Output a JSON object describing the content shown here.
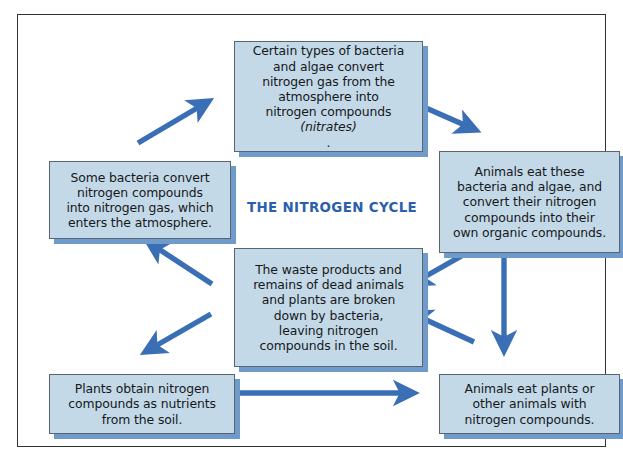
{
  "diagram": {
    "title": "THE NITROGEN CYCLE",
    "accent_color": "#2a5fad",
    "arrow_color": "#3a6fb5",
    "box_fill": "#c3d9e8",
    "box_border": "#5a6470",
    "box_shadow": "#6e9bc9",
    "frame_border": "#2f3336"
  },
  "boxes": {
    "fixation": {
      "text_plain": "Certain types of bacteria and algae convert nitrogen gas from the atmosphere into nitrogen compounds (nitrates).",
      "line1": "Certain types of bacteria",
      "line2": "and algae convert",
      "line3": "nitrogen gas from the",
      "line4": "atmosphere into",
      "line5": "nitrogen compounds",
      "line6_italic": "(nitrates)",
      "line6_tail": "."
    },
    "animals_eat_microbes": {
      "text_plain": "Animals eat these bacteria and algae, and convert their nitrogen compounds into their own organic compounds.",
      "line1": "Animals eat these",
      "line2": "bacteria and algae, and",
      "line3": "convert their nitrogen",
      "line4": "compounds into their",
      "line5": "own organic compounds."
    },
    "denitrification": {
      "text_plain": "Some bacteria convert nitrogen compounds into nitrogen gas, which enters the atmosphere.",
      "line1": "Some bacteria convert",
      "line2": "nitrogen compounds",
      "line3": "into nitrogen gas, which",
      "line4": "enters the atmosphere."
    },
    "decomposition": {
      "text_plain": "The waste products and remains of dead animals and plants are broken down by bacteria, leaving nitrogen compounds in the soil.",
      "line1": "The waste products and",
      "line2": "remains of dead animals",
      "line3": "and plants are broken",
      "line4": "down by bacteria,",
      "line5": "leaving nitrogen",
      "line6": "compounds in the soil."
    },
    "plants_uptake": {
      "text_plain": "Plants obtain nitrogen compounds as nutrients from the soil.",
      "line1": "Plants obtain nitrogen",
      "line2": "compounds as nutrients",
      "line3": "from the soil."
    },
    "animals_eat_plants": {
      "text_plain": "Animals eat plants or other animals with nitrogen compounds.",
      "line1": "Animals eat plants or",
      "line2": "other animals with",
      "line3": "nitrogen compounds."
    }
  },
  "arrows": [
    {
      "name": "denitrification-to-fixation",
      "from": "denitrification",
      "to": "fixation",
      "direction": "up-right"
    },
    {
      "name": "fixation-to-animals-eat-microbes",
      "from": "fixation",
      "to": "animals_eat_microbes",
      "direction": "down-right"
    },
    {
      "name": "animals-eat-microbes-to-decomposition",
      "from": "animals_eat_microbes",
      "to": "decomposition",
      "direction": "down-left"
    },
    {
      "name": "animals-eat-microbes-to-animals-eat-plants",
      "from": "animals_eat_microbes",
      "to": "animals_eat_plants",
      "direction": "down"
    },
    {
      "name": "animals-eat-plants-to-decomposition",
      "from": "animals_eat_plants",
      "to": "decomposition",
      "direction": "up-left"
    },
    {
      "name": "decomposition-to-denitrification",
      "from": "decomposition",
      "to": "denitrification",
      "direction": "up-left"
    },
    {
      "name": "decomposition-to-plants-uptake",
      "from": "decomposition",
      "to": "plants_uptake",
      "direction": "down-left"
    },
    {
      "name": "plants-uptake-to-animals-eat-plants",
      "from": "plants_uptake",
      "to": "animals_eat_plants",
      "direction": "right"
    }
  ]
}
